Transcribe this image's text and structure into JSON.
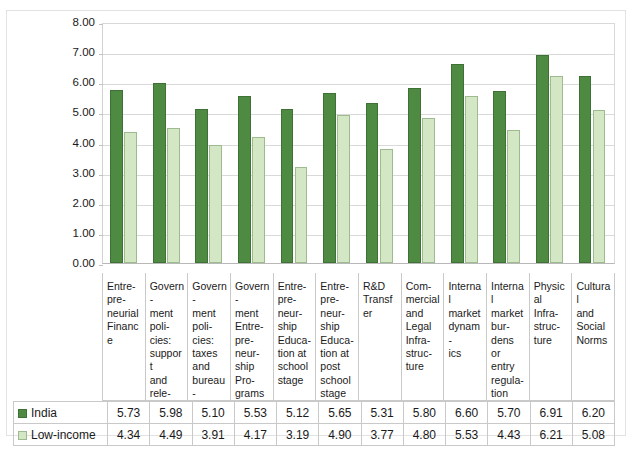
{
  "chart_data": {
    "type": "bar",
    "title": "",
    "xlabel": "",
    "ylabel": "",
    "ylim": [
      0,
      8
    ],
    "ytick_step": 1,
    "ytick_labels": [
      "8.00",
      "7.00",
      "6.00",
      "5.00",
      "4.00",
      "3.00",
      "2.00",
      "1.00",
      "0.00"
    ],
    "grid": true,
    "legend_position": "table-row-labels",
    "categories": [
      "Entrepreneurial Finance",
      "Government policies: support and relevance",
      "Government policies: taxes and bureaucracy",
      "Government Entrepreneurship Programs",
      "Entrepreneurship Education at school stage",
      "Entrepreneurship Education at post school stage",
      "R&D Transfer",
      "Commercial and Legal Infrastructure",
      "Internal market dynamics",
      "Internal market burdens or entry regulation",
      "Physical Infrastructure",
      "Cultural and Social Norms"
    ],
    "category_labels_wrapped": [
      "Entre-\npre-\nneurial\nFinance",
      "Govern-\nment\npoli-\ncies:\nsupport\nand\nrele-\nvance",
      "Govern-\nment\npoli-\ncies:\ntaxes\nand\nbureau-\ncracy",
      "Govern-\nment\nEntre-\npre-\nneur-\nship\nPro-\ngrams",
      "Entre-\npre-\nneur-\nship\nEduca-\ntion at\nschool\nstage",
      "Entre-\npre-\nneur-\nship\nEduca-\ntion at\npost\nschool\nstage",
      "R&D\nTransfer",
      "Com-\nmercial\nand\nLegal\nInfra-\nstruc-\nture",
      "Internal\nmarket\ndynam-\nics",
      "Internal\nmarket\nbur-\ndens or\nentry\nregula-\ntion",
      "Physical\nInfra-\nstruc-\nture",
      "Cultural\nand\nSocial\nNorms"
    ],
    "series": [
      {
        "name": "India",
        "color": "#4F8A42",
        "values": [
          5.73,
          5.98,
          5.1,
          5.53,
          5.12,
          5.65,
          5.31,
          5.8,
          6.6,
          5.7,
          6.91,
          6.2
        ]
      },
      {
        "name": "Low-income",
        "color": "#D3E7C5",
        "values": [
          4.34,
          4.49,
          3.91,
          4.17,
          3.19,
          4.9,
          3.77,
          4.8,
          5.53,
          4.43,
          6.21,
          5.08
        ]
      }
    ]
  }
}
